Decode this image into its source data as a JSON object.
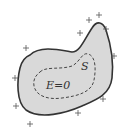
{
  "diagram": {
    "title": "",
    "labels": {
      "surface": "S",
      "interior_field": "E=0"
    },
    "conductor": {
      "fill": "#d9d9d9",
      "stroke": "#333333"
    },
    "gaussian_surface": {
      "style": "dashed",
      "stroke": "#444444"
    },
    "charges": {
      "symbol": "+",
      "count": 12,
      "positions": [
        [
          26,
          48
        ],
        [
          15,
          78
        ],
        [
          16,
          106
        ],
        [
          30,
          124
        ],
        [
          78,
          113
        ],
        [
          103,
          99
        ],
        [
          114,
          56
        ],
        [
          106,
          29
        ],
        [
          99,
          15
        ],
        [
          89,
          20
        ],
        [
          80,
          33
        ]
      ]
    }
  }
}
